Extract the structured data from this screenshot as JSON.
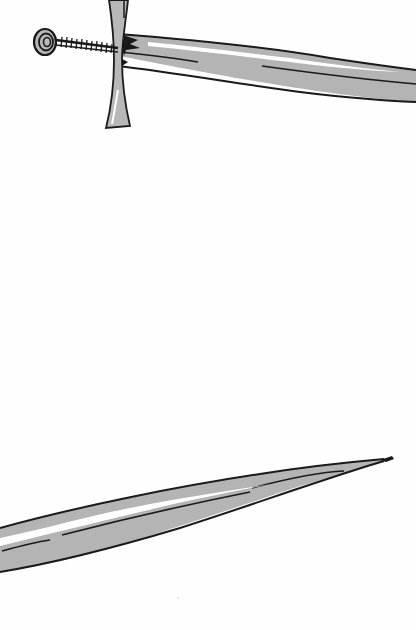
{
  "image": {
    "subject": "hand-drawn sword illustration",
    "width": 416,
    "height": 630,
    "background_color": "#fefefe",
    "colors": {
      "blade_fill": "#b4b4b4",
      "outline": "#1a1a1a",
      "highlight": "#ffffff",
      "guard_fill": "#b8b8b8"
    },
    "parts": {
      "top": [
        "pommel",
        "grip",
        "crossguard",
        "blade-base"
      ],
      "bottom": [
        "blade-tip"
      ]
    }
  }
}
